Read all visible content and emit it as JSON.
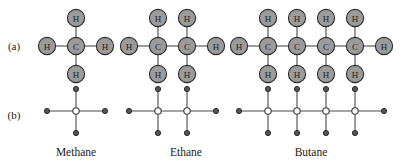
{
  "figure": {
    "width": 409,
    "height": 163,
    "background": "#ffffff"
  },
  "colors": {
    "atom_fill": "#9b9b9b",
    "atom_stroke": "#2b2b2b",
    "bond_stroke": "#4a4a4a",
    "node_open_fill": "#ffffff",
    "node_filled_fill": "#555555",
    "text": "#1a1a1a"
  },
  "row_labels": [
    {
      "id": "row-a",
      "text": "(a)",
      "x": 14,
      "y": 46,
      "description": "structural formula row with labelled H and C atoms"
    },
    {
      "id": "row-b",
      "text": "(b)",
      "x": 14,
      "y": 115,
      "description": "simplified stick-and-node row"
    }
  ],
  "captions": [
    {
      "id": "caption-methane",
      "text": "Methane",
      "x": 76,
      "y": 156
    },
    {
      "id": "caption-ethane",
      "text": "Ethane",
      "x": 186,
      "y": 156
    },
    {
      "id": "caption-butane",
      "text": "Butane",
      "x": 311,
      "y": 156
    }
  ],
  "geometry": {
    "row_a_center_y": 46,
    "row_b_center_y": 111,
    "atom_spacing_x": 29,
    "atom_spacing_y": 28,
    "atom_radius": 8.6,
    "node_radius_open": 3.2,
    "node_radius_filled": 2.6,
    "stick_spacing_x": 29,
    "stick_arm_y": 22
  },
  "molecules": [
    {
      "id": "methane",
      "name": "Methane",
      "formula": "CH4",
      "carbon_count": 1,
      "hydrogen_count": 4,
      "carbon_x": [
        76
      ],
      "left_hydrogen_x": 47,
      "right_hydrogen_x": 105,
      "atoms_row_a": [
        {
          "label": "C",
          "x": 76,
          "y": 46,
          "kind": "carbon"
        },
        {
          "label": "H",
          "x": 76,
          "y": 18,
          "kind": "hydrogen"
        },
        {
          "label": "H",
          "x": 76,
          "y": 74,
          "kind": "hydrogen"
        },
        {
          "label": "H",
          "x": 47,
          "y": 46,
          "kind": "hydrogen"
        },
        {
          "label": "H",
          "x": 105,
          "y": 46,
          "kind": "hydrogen"
        }
      ]
    },
    {
      "id": "ethane",
      "name": "Ethane",
      "formula": "C2H6",
      "carbon_count": 2,
      "hydrogen_count": 6,
      "carbon_x": [
        158,
        187
      ],
      "left_hydrogen_x": 129,
      "right_hydrogen_x": 216,
      "atoms_row_a": [
        {
          "label": "C",
          "x": 158,
          "y": 46,
          "kind": "carbon"
        },
        {
          "label": "C",
          "x": 187,
          "y": 46,
          "kind": "carbon"
        },
        {
          "label": "H",
          "x": 158,
          "y": 18,
          "kind": "hydrogen"
        },
        {
          "label": "H",
          "x": 187,
          "y": 18,
          "kind": "hydrogen"
        },
        {
          "label": "H",
          "x": 158,
          "y": 74,
          "kind": "hydrogen"
        },
        {
          "label": "H",
          "x": 187,
          "y": 74,
          "kind": "hydrogen"
        },
        {
          "label": "H",
          "x": 129,
          "y": 46,
          "kind": "hydrogen"
        },
        {
          "label": "H",
          "x": 216,
          "y": 46,
          "kind": "hydrogen"
        }
      ]
    },
    {
      "id": "butane",
      "name": "Butane",
      "formula": "C4H10",
      "carbon_count": 4,
      "hydrogen_count": 10,
      "carbon_x": [
        268,
        297,
        326,
        355
      ],
      "left_hydrogen_x": 239,
      "right_hydrogen_x": 384,
      "atoms_row_a": [
        {
          "label": "C",
          "x": 268,
          "y": 46,
          "kind": "carbon"
        },
        {
          "label": "C",
          "x": 297,
          "y": 46,
          "kind": "carbon"
        },
        {
          "label": "C",
          "x": 326,
          "y": 46,
          "kind": "carbon"
        },
        {
          "label": "C",
          "x": 355,
          "y": 46,
          "kind": "carbon"
        },
        {
          "label": "H",
          "x": 268,
          "y": 18,
          "kind": "hydrogen"
        },
        {
          "label": "H",
          "x": 297,
          "y": 18,
          "kind": "hydrogen"
        },
        {
          "label": "H",
          "x": 326,
          "y": 18,
          "kind": "hydrogen"
        },
        {
          "label": "H",
          "x": 355,
          "y": 18,
          "kind": "hydrogen"
        },
        {
          "label": "H",
          "x": 268,
          "y": 74,
          "kind": "hydrogen"
        },
        {
          "label": "H",
          "x": 297,
          "y": 74,
          "kind": "hydrogen"
        },
        {
          "label": "H",
          "x": 326,
          "y": 74,
          "kind": "hydrogen"
        },
        {
          "label": "H",
          "x": 355,
          "y": 74,
          "kind": "hydrogen"
        },
        {
          "label": "H",
          "x": 239,
          "y": 46,
          "kind": "hydrogen"
        },
        {
          "label": "H",
          "x": 384,
          "y": 46,
          "kind": "hydrogen"
        }
      ]
    }
  ]
}
